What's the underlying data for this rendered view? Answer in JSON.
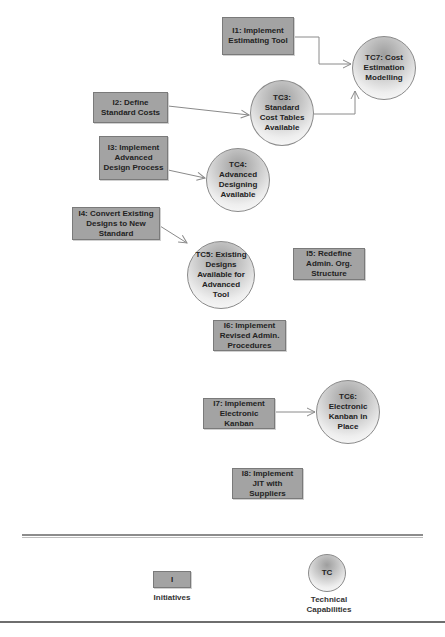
{
  "diagram": {
    "initiatives": [
      {
        "id": "I1",
        "label": "I1: Implement Estimating Tool"
      },
      {
        "id": "I2",
        "label": "I2: Define Standard Costs"
      },
      {
        "id": "I3",
        "label": "I3: Implement Advanced Design Process"
      },
      {
        "id": "I4",
        "label": "I4: Convert Existing Designs to New Standard"
      },
      {
        "id": "I5",
        "label": "I5: Redefine Admin. Org. Structure"
      },
      {
        "id": "I6",
        "label": "I6: Implement Revised Admin. Procedures"
      },
      {
        "id": "I7",
        "label": "I7: Implement Electronic Kanban"
      },
      {
        "id": "I8",
        "label": "I8: Implement JIT with Suppliers"
      }
    ],
    "capabilities": [
      {
        "id": "TC3",
        "label": "TC3: Standard Cost Tables Available"
      },
      {
        "id": "TC4",
        "label": "TC4: Advanced Designing Available"
      },
      {
        "id": "TC5",
        "label": "TC5: Existing Designs Available for Advanced Tool"
      },
      {
        "id": "TC6",
        "label": "TC6: Electronic Kanban in Place"
      },
      {
        "id": "TC7",
        "label": "TC7: Cost Estimation Modelling"
      }
    ],
    "edges": [
      {
        "from": "I1",
        "to": "TC7"
      },
      {
        "from": "I2",
        "to": "TC3"
      },
      {
        "from": "TC3",
        "to": "TC7"
      },
      {
        "from": "I3",
        "to": "TC4"
      },
      {
        "from": "I4",
        "to": "TC5"
      },
      {
        "from": "I7",
        "to": "TC6"
      }
    ]
  },
  "legend": {
    "initiative_symbol": "I",
    "initiative_label": "Initiatives",
    "capability_symbol": "TC",
    "capability_label": "Technical Capabilities"
  },
  "colors": {
    "initiative_fill": "#a3a3a3",
    "line": "#8a8a8a"
  }
}
